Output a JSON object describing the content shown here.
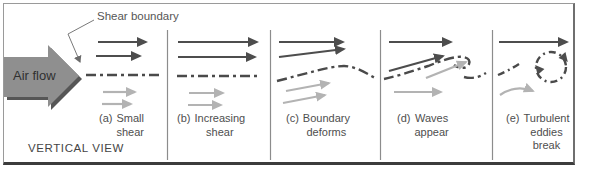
{
  "figure": {
    "airflow_label": "Air flow",
    "shear_boundary_label": "Shear boundary",
    "view_label": "VERTICAL VIEW"
  },
  "panels": [
    {
      "prefix": "(a)",
      "label": "Small\nshear"
    },
    {
      "prefix": "(b)",
      "label": "Increasing\nshear"
    },
    {
      "prefix": "(c)",
      "label": "Boundary\ndeforms"
    },
    {
      "prefix": "(d)",
      "label": "Waves\nappear"
    },
    {
      "prefix": "(e)",
      "label": "Turbulent\neddies\nbreak"
    }
  ],
  "icons": {
    "flow_arrow": "large-right-block-arrow",
    "upper_flow_arrows": "dark-right-arrows-fast-flow",
    "lower_flow_arrows": "light-right-arrows-slow-flow",
    "shear_boundary": "dash-dot-line",
    "eddy": "dash-dot-circle-with-clockwise-arrowheads",
    "leader": "bent-pointer-line"
  },
  "colors": {
    "fast_flow_arrow": "#4d4d4d",
    "slow_flow_arrow": "#b3b3b3",
    "boundary_line": "#4a4a4a",
    "flow_block_fill": "#8f8f8f",
    "flow_block_shadow": "#565656",
    "frame_border": "#9a9a9a",
    "text": "#4e4e4e"
  }
}
